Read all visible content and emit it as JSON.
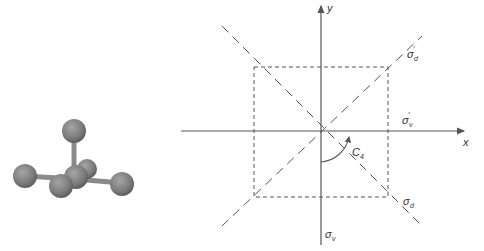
{
  "molecule": {
    "description": "square planar AB4 molecule with apical atom (ball-and-stick)",
    "atom_color": "#7a7a7a",
    "bond_color": "#8a8a8a"
  },
  "diagram": {
    "axes": {
      "x_label": "x",
      "y_label": "y"
    },
    "labels": {
      "sigma_d_prime": "σ",
      "sigma_d_prime_sub": "d",
      "sigma_d_prime_mark": "′",
      "sigma_v_prime": "σ",
      "sigma_v_prime_sub": "v",
      "sigma_v_prime_mark": "′",
      "sigma_d": "σ",
      "sigma_d_sub": "d",
      "sigma_v": "σ",
      "sigma_v_sub": "v",
      "c4": "C",
      "c4_sub": "4"
    },
    "colors": {
      "line": "#555555"
    }
  }
}
